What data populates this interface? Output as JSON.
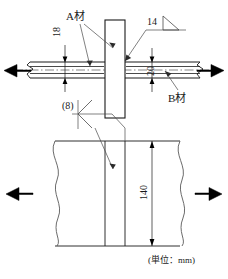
{
  "drawing": {
    "title": "",
    "unit_note": "(単位：mm)",
    "stroke_color": "#1a1a1a",
    "thin_stroke_color": "#4a4a4a",
    "background": "#ffffff",
    "labels": {
      "material_a": "A材",
      "material_b": "B材",
      "weld_size_top": "14",
      "weld_size_bottom": "(8)",
      "dim_thickness_a": "18",
      "dim_thickness_b": "20",
      "dim_width": "140"
    },
    "views": {
      "elevation": {
        "name": "正面図",
        "vertical_plate": {
          "label_ref": "material_a",
          "x": 105,
          "y": 20,
          "width": 20,
          "height": 98
        },
        "horizontal_plate": {
          "label_ref": "material_b",
          "y_top": 62,
          "y_bottom": 78,
          "x_left": 26,
          "x_right": 200
        },
        "load_arrow_left": "arrow-left",
        "load_arrow_right": "arrow-right",
        "centerline": "chain-line"
      },
      "plan": {
        "name": "平面図",
        "y_top": 141,
        "y_bottom": 246,
        "break_line_left_x": 55,
        "break_line_right_x": 180,
        "plate_edge_x1": 105,
        "plate_edge_x2": 125,
        "load_arrow_left": "arrow-left",
        "load_arrow_right": "arrow-right"
      }
    },
    "weld_symbols": {
      "fillet_top": {
        "size": "14",
        "glyph": "fillet-triangle-icon",
        "arrow_target": "vertical-plate-right-face"
      },
      "fillet_bottom": {
        "size": "(8)",
        "glyph": "fillet-cross-icon",
        "arrow_target": "plan-plate-seam"
      }
    }
  }
}
